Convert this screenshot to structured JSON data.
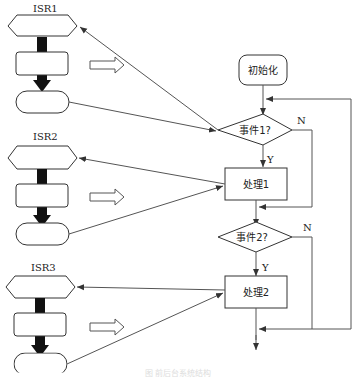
{
  "diagram": {
    "isr_blocks": [
      {
        "label": "ISR1"
      },
      {
        "label": "ISR2"
      },
      {
        "label": "ISR3"
      }
    ],
    "main_flow": {
      "init": "初始化",
      "decision1": "事件1?",
      "process1": "处理1",
      "decision2": "事件2?",
      "process2": "处理2",
      "yes_label": "Y",
      "no_label": "N"
    },
    "caption": "图 前后台系统结构"
  }
}
